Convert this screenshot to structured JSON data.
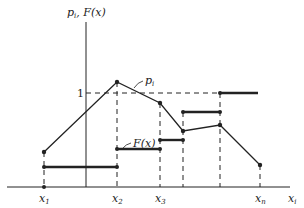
{
  "diagram": {
    "y_axis_label": "p",
    "y_axis_label_sub": "i",
    "y_axis_label_rest": ", F(x)",
    "x_axis_label": "x",
    "x_axis_label_sub": "i",
    "level_one_label": "1",
    "pmf_label": "p",
    "pmf_label_sub": "i",
    "cdf_label": "F(x)",
    "x_ticks": [
      {
        "name": "x",
        "sub": "1"
      },
      {
        "name": "x",
        "sub": "2"
      },
      {
        "name": "x",
        "sub": "3"
      },
      {
        "name": "x",
        "sub": "n"
      }
    ],
    "colors": {
      "line": "#222222",
      "background": "#ffffff"
    }
  }
}
